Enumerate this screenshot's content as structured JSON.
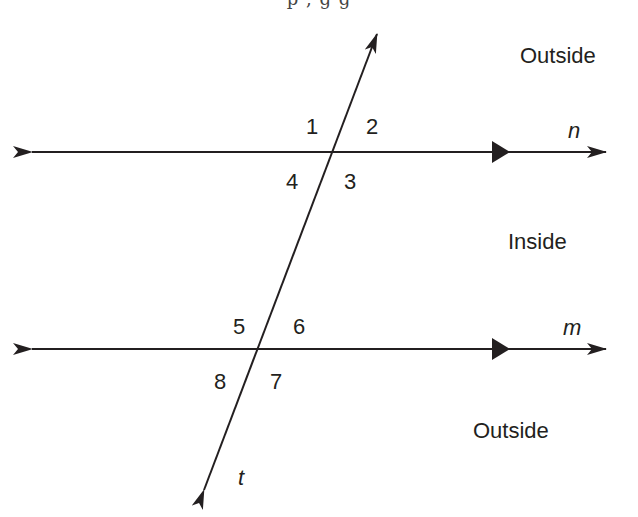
{
  "top_cropped_text": "p , g g",
  "diagram": {
    "lines": {
      "n": {
        "label": "n",
        "y": 152
      },
      "m": {
        "label": "m",
        "y": 349
      },
      "t": {
        "label": "t"
      }
    },
    "angles": [
      {
        "id": "1",
        "label": "1"
      },
      {
        "id": "2",
        "label": "2"
      },
      {
        "id": "3",
        "label": "3"
      },
      {
        "id": "4",
        "label": "4"
      },
      {
        "id": "5",
        "label": "5"
      },
      {
        "id": "6",
        "label": "6"
      },
      {
        "id": "7",
        "label": "7"
      },
      {
        "id": "8",
        "label": "8"
      }
    ],
    "regions": {
      "outside_top": "Outside",
      "inside": "Inside",
      "outside_bottom": "Outside"
    },
    "colors": {
      "stroke": "#231f20",
      "background": "#ffffff"
    }
  }
}
